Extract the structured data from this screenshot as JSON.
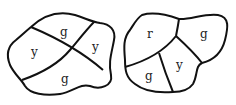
{
  "maps": [
    {
      "name": "left-map",
      "regions": [
        {
          "label": "g",
          "position": "top"
        },
        {
          "label": "y",
          "position": "left"
        },
        {
          "label": "y",
          "position": "right"
        },
        {
          "label": "g",
          "position": "bottom"
        }
      ]
    },
    {
      "name": "right-map",
      "regions": [
        {
          "label": "r",
          "position": "top-left"
        },
        {
          "label": "g",
          "position": "top-right"
        },
        {
          "label": "g",
          "position": "bottom-left"
        },
        {
          "label": "y",
          "position": "bottom-middle"
        }
      ]
    }
  ]
}
